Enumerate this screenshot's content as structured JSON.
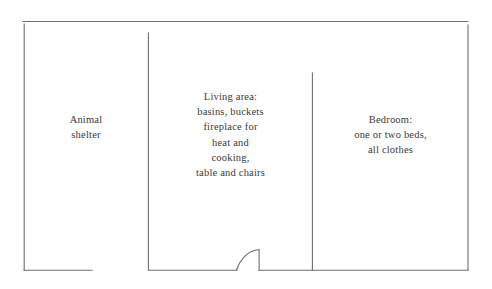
{
  "diagram": {
    "type": "floor-plan",
    "title": "",
    "line_color": "#6e6e6e",
    "text_color": "#3a3a3a",
    "background": "#ffffff",
    "rooms": [
      {
        "id": "animal-shelter",
        "label": "Animal\nshelter",
        "lines": [
          "Animal",
          "shelter"
        ]
      },
      {
        "id": "living-area",
        "label": "Living area:\nbasins, buckets\nfireplace for\nheat and\ncooking,\ntable and chairs",
        "lines": [
          "Living area:",
          "basins, buckets",
          "fireplace for",
          "heat and",
          "cooking,",
          "table and chairs"
        ]
      },
      {
        "id": "bedroom",
        "label": "Bedroom:\none or two beds,\nall clothes",
        "lines": [
          "Bedroom:",
          "one or two beds,",
          "all clothes"
        ]
      }
    ],
    "features": [
      {
        "id": "door-swing",
        "name": "door with swing arc",
        "room": "living-area",
        "position": "bottom wall"
      },
      {
        "id": "opening-left",
        "name": "wall opening",
        "between": "animal-shelter and living-area",
        "position": "bottom wall"
      },
      {
        "id": "interior-wall-1",
        "name": "partition wall",
        "between": "animal-shelter and living-area"
      },
      {
        "id": "interior-wall-2",
        "name": "partition wall",
        "between": "living-area and bedroom"
      }
    ]
  }
}
